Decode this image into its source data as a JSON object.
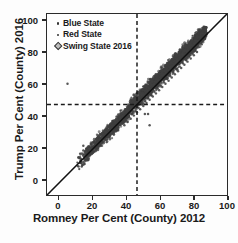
{
  "chart_data": {
    "type": "scatter",
    "title": "",
    "xlabel": "Romney Per Cent (County) 2012",
    "ylabel": "Trump Per Cent (County) 2016",
    "xlim": [
      -7,
      107
    ],
    "ylim": [
      -7,
      107
    ],
    "xticks": [
      0,
      20,
      40,
      60,
      80,
      100
    ],
    "yticks": [
      0,
      20,
      40,
      60,
      80,
      100
    ],
    "xtick_labels": [
      "0",
      "20",
      "40",
      "60",
      "80",
      "100"
    ],
    "ytick_labels": [
      "0",
      "20",
      "40",
      "60",
      "80",
      "100"
    ],
    "grid": false,
    "legend_position": "upper-left",
    "legend": [
      {
        "label": "Blue State",
        "marker": "dot",
        "color": "#333333"
      },
      {
        "label": "Red State",
        "marker": "dot",
        "color": "#333333"
      },
      {
        "label": "Swing State 2016",
        "marker": "diamond",
        "color": "#bdbdbd"
      }
    ],
    "reference_lines": [
      {
        "orientation": "horizontal",
        "value": 50,
        "style": "dashed",
        "color": "#1a1a1a"
      },
      {
        "orientation": "vertical",
        "value": 50,
        "style": "dashed",
        "color": "#1a1a1a"
      },
      {
        "orientation": "diagonal",
        "equation": "y = x",
        "style": "solid",
        "color": "#111111"
      }
    ],
    "annotations": [
      "Dense cloud of county points follows the y = x identity line",
      "Most points lie slightly above the identity line (Trump 2016 > Romney 2012)",
      "One isolated outlier near (6, 63)"
    ],
    "points": [
      [
        6,
        63
      ],
      [
        13,
        11
      ],
      [
        15,
        11
      ],
      [
        14,
        19
      ],
      [
        16,
        21
      ],
      [
        17,
        20
      ],
      [
        18,
        22
      ],
      [
        16,
        24
      ],
      [
        19,
        21
      ],
      [
        20,
        23
      ],
      [
        18,
        18
      ],
      [
        21,
        25
      ],
      [
        22,
        26
      ],
      [
        23,
        27
      ],
      [
        24,
        28
      ],
      [
        25,
        29
      ],
      [
        26,
        30
      ],
      [
        27,
        31
      ],
      [
        28,
        32
      ],
      [
        29,
        33
      ],
      [
        30,
        34
      ],
      [
        31,
        35
      ],
      [
        32,
        36
      ],
      [
        33,
        37
      ],
      [
        34,
        38
      ],
      [
        35,
        39
      ],
      [
        36,
        40
      ],
      [
        33,
        36
      ],
      [
        34,
        35
      ],
      [
        30,
        31
      ],
      [
        31,
        33
      ],
      [
        32,
        34
      ],
      [
        28,
        30
      ],
      [
        29,
        30
      ],
      [
        27,
        28
      ],
      [
        26,
        27
      ],
      [
        25,
        26
      ],
      [
        24,
        25
      ],
      [
        23,
        24
      ],
      [
        22,
        23
      ],
      [
        21,
        22
      ],
      [
        20,
        21
      ],
      [
        19,
        20
      ],
      [
        37,
        41
      ],
      [
        38,
        42
      ],
      [
        39,
        43
      ],
      [
        40,
        44
      ],
      [
        41,
        45
      ],
      [
        42,
        46
      ],
      [
        43,
        47
      ],
      [
        44,
        48
      ],
      [
        45,
        49
      ],
      [
        46,
        50
      ],
      [
        47,
        51
      ],
      [
        48,
        52
      ],
      [
        49,
        53
      ],
      [
        50,
        54
      ],
      [
        51,
        55
      ],
      [
        52,
        56
      ],
      [
        53,
        57
      ],
      [
        54,
        58
      ],
      [
        55,
        59
      ],
      [
        56,
        60
      ],
      [
        57,
        61
      ],
      [
        58,
        62
      ],
      [
        59,
        63
      ],
      [
        60,
        64
      ],
      [
        61,
        65
      ],
      [
        62,
        66
      ],
      [
        63,
        67
      ],
      [
        64,
        68
      ],
      [
        65,
        69
      ],
      [
        66,
        70
      ],
      [
        67,
        71
      ],
      [
        68,
        72
      ],
      [
        69,
        73
      ],
      [
        70,
        74
      ],
      [
        71,
        75
      ],
      [
        72,
        76
      ],
      [
        73,
        77
      ],
      [
        74,
        78
      ],
      [
        75,
        79
      ],
      [
        76,
        80
      ],
      [
        77,
        81
      ],
      [
        78,
        82
      ],
      [
        79,
        83
      ],
      [
        80,
        84
      ],
      [
        81,
        85
      ],
      [
        82,
        86
      ],
      [
        83,
        87
      ],
      [
        84,
        88
      ],
      [
        85,
        89
      ],
      [
        86,
        90
      ],
      [
        87,
        91
      ],
      [
        88,
        92
      ],
      [
        89,
        93
      ],
      [
        90,
        94
      ],
      [
        91,
        94
      ],
      [
        92,
        95
      ],
      [
        93,
        95
      ],
      [
        36,
        38
      ],
      [
        38,
        40
      ],
      [
        40,
        42
      ],
      [
        42,
        44
      ],
      [
        44,
        46
      ],
      [
        46,
        48
      ],
      [
        48,
        50
      ],
      [
        50,
        52
      ],
      [
        52,
        54
      ],
      [
        54,
        56
      ],
      [
        56,
        58
      ],
      [
        58,
        60
      ],
      [
        60,
        62
      ],
      [
        62,
        64
      ],
      [
        64,
        66
      ],
      [
        66,
        68
      ],
      [
        68,
        70
      ],
      [
        70,
        72
      ],
      [
        72,
        74
      ],
      [
        74,
        76
      ],
      [
        76,
        78
      ],
      [
        78,
        80
      ],
      [
        80,
        82
      ],
      [
        82,
        84
      ],
      [
        84,
        86
      ],
      [
        86,
        88
      ],
      [
        88,
        90
      ],
      [
        90,
        92
      ],
      [
        55,
        44
      ],
      [
        57,
        44
      ],
      [
        58,
        37
      ],
      [
        38,
        36
      ],
      [
        36,
        34
      ],
      [
        41,
        38
      ],
      [
        43,
        40
      ],
      [
        45,
        42
      ],
      [
        47,
        44
      ],
      [
        49,
        46
      ],
      [
        51,
        48
      ],
      [
        53,
        50
      ],
      [
        55,
        52
      ],
      [
        57,
        54
      ],
      [
        59,
        56
      ],
      [
        61,
        58
      ],
      [
        63,
        60
      ],
      [
        65,
        62
      ],
      [
        67,
        64
      ],
      [
        69,
        66
      ],
      [
        71,
        68
      ],
      [
        73,
        70
      ],
      [
        75,
        72
      ],
      [
        77,
        74
      ],
      [
        79,
        76
      ],
      [
        81,
        78
      ],
      [
        83,
        80
      ],
      [
        85,
        82
      ],
      [
        87,
        84
      ],
      [
        89,
        86
      ],
      [
        91,
        88
      ],
      [
        84,
        79
      ],
      [
        86,
        81
      ],
      [
        88,
        83
      ],
      [
        80,
        75
      ],
      [
        82,
        77
      ],
      [
        78,
        73
      ],
      [
        76,
        71
      ],
      [
        74,
        69
      ],
      [
        72,
        67
      ],
      [
        70,
        65
      ],
      [
        68,
        63
      ],
      [
        66,
        61
      ],
      [
        64,
        59
      ],
      [
        62,
        57
      ],
      [
        60,
        55
      ],
      [
        58,
        53
      ],
      [
        56,
        51
      ],
      [
        54,
        49
      ],
      [
        52,
        47
      ],
      [
        50,
        45
      ],
      [
        48,
        43
      ],
      [
        46,
        41
      ],
      [
        44,
        39
      ],
      [
        42,
        37
      ]
    ],
    "n_points_approx": 3100
  }
}
